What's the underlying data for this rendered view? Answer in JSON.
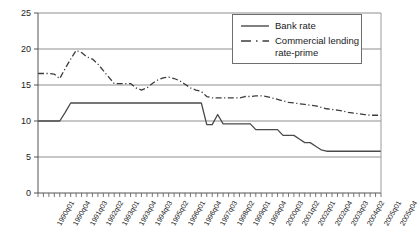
{
  "chart_data": {
    "type": "line",
    "title": "",
    "xlabel": "",
    "ylabel": "",
    "ylim": [
      0,
      25
    ],
    "yticks": [
      0,
      5,
      10,
      15,
      20,
      25
    ],
    "grid": "horizontal",
    "legend_position": "top-right",
    "x": [
      "1990q01",
      "1990q02",
      "1990q03",
      "1990q04",
      "1991q01",
      "1991q02",
      "1991q03",
      "1991q04",
      "1992q01",
      "1992q02",
      "1992q03",
      "1992q04",
      "1993q01",
      "1993q02",
      "1993q03",
      "1993q04",
      "1994q01",
      "1994q02",
      "1994q03",
      "1994q04",
      "1995q01",
      "1995q02",
      "1995q03",
      "1995q04",
      "1996q01",
      "1996q02",
      "1996q03",
      "1996q04",
      "1997q01",
      "1997q02",
      "1997q03",
      "1997q04",
      "1998q01",
      "1998q02",
      "1998q03",
      "1998q04",
      "1999q01",
      "1999q02",
      "1999q03",
      "1999q04",
      "2000q01",
      "2000q02",
      "2000q03",
      "2000q04",
      "2001q01",
      "2001q02",
      "2001q03",
      "2001q04",
      "2002q01",
      "2002q02",
      "2002q03",
      "2002q04",
      "2003q01",
      "2003q02",
      "2003q03",
      "2003q04",
      "2004q01",
      "2004q02",
      "2004q03",
      "2004q04",
      "2005q01",
      "2005q02",
      "2005q03",
      "2005q04"
    ],
    "xtick_labels": [
      "1990q01",
      "1990q04",
      "1991q03",
      "1992q02",
      "1993q01",
      "1993q04",
      "1994q03",
      "1995q02",
      "1996q01",
      "1996q04",
      "1997q03",
      "1998q02",
      "1999q01",
      "1999q04",
      "2000q03",
      "2001q02",
      "2002q01",
      "2002q04",
      "2003q03",
      "2004q02",
      "2005q01",
      "2005q04"
    ],
    "xtick_label_every": 3,
    "series": [
      {
        "name": "Bank rate",
        "style": "solid",
        "color": "#4a4a4a",
        "values": [
          10.0,
          10.0,
          10.0,
          10.0,
          10.0,
          11.2,
          12.5,
          12.5,
          12.5,
          12.5,
          12.5,
          12.5,
          12.5,
          12.5,
          12.5,
          12.5,
          12.5,
          12.5,
          12.5,
          12.5,
          12.5,
          12.5,
          12.5,
          12.5,
          12.5,
          12.5,
          12.5,
          12.5,
          12.5,
          12.5,
          12.5,
          9.5,
          9.5,
          10.9,
          9.6,
          9.6,
          9.6,
          9.6,
          9.6,
          9.6,
          8.8,
          8.8,
          8.8,
          8.8,
          8.8,
          8.0,
          8.0,
          8.0,
          7.5,
          7.0,
          7.0,
          6.5,
          6.0,
          5.8,
          5.8,
          5.8,
          5.8,
          5.8,
          5.8,
          5.8,
          5.8,
          5.8,
          5.8,
          5.8
        ]
      },
      {
        "name": "Commercial lending rate-prime",
        "style": "dash-dot",
        "color": "#3c3c3c",
        "values": [
          16.6,
          16.6,
          16.6,
          16.5,
          15.9,
          17.3,
          18.6,
          19.8,
          19.5,
          18.9,
          18.6,
          17.9,
          17.0,
          16.1,
          15.2,
          15.2,
          15.2,
          15.2,
          14.6,
          14.3,
          14.6,
          15.2,
          15.7,
          16.0,
          16.1,
          15.9,
          15.6,
          15.1,
          14.6,
          14.3,
          14.1,
          13.4,
          13.2,
          13.2,
          13.2,
          13.2,
          13.2,
          13.2,
          13.4,
          13.4,
          13.5,
          13.5,
          13.4,
          13.2,
          13.0,
          12.8,
          12.6,
          12.5,
          12.4,
          12.3,
          12.2,
          12.1,
          11.9,
          11.7,
          11.6,
          11.5,
          11.4,
          11.2,
          11.1,
          11.0,
          10.9,
          10.8,
          10.8,
          10.8
        ]
      }
    ]
  },
  "legend": {
    "items": [
      {
        "label": "Bank rate",
        "label2": ""
      },
      {
        "label": "Commercial lending",
        "label2": "rate-prime"
      }
    ]
  }
}
